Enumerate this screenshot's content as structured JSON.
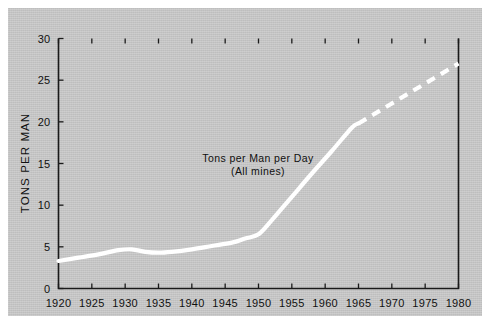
{
  "figure": {
    "background_color": "#c9c9c9",
    "page_color": "#ffffff",
    "line_color": "#ffffff",
    "axis_color": "#1a1a1a"
  },
  "chart_data": {
    "type": "line",
    "title": "",
    "xlabel": "",
    "ylabel": "TONS PER MAN",
    "xlim": [
      1920,
      1980
    ],
    "ylim": [
      0,
      30
    ],
    "grid": false,
    "legend_position": "none",
    "annotations": [
      {
        "line1": "Tons per Man per Day",
        "line2": "(All mines)",
        "x": 1950,
        "y": 17
      }
    ],
    "xticks": [
      1920,
      1925,
      1930,
      1935,
      1940,
      1945,
      1950,
      1955,
      1960,
      1965,
      1970,
      1975,
      1980
    ],
    "xticklabels": [
      "1920",
      "1925",
      "1930",
      "1935",
      "1940",
      "1945",
      "1950",
      "1955",
      "1960",
      "1965",
      "1970",
      "1975",
      "1980"
    ],
    "yticks": [
      0,
      5,
      10,
      15,
      20,
      25,
      30
    ],
    "yticklabels": [
      "0",
      "5",
      "10",
      "15",
      "20",
      "25",
      "30"
    ],
    "series": [
      {
        "name": "Tons per Man per Day (All mines)",
        "style": "solid",
        "color": "#ffffff",
        "x": [
          1920,
          1923,
          1926,
          1929,
          1931,
          1933,
          1935,
          1937,
          1940,
          1943,
          1946,
          1948,
          1950,
          1952,
          1955,
          1958,
          1961,
          1964,
          1965
        ],
        "values": [
          3.3,
          3.7,
          4.1,
          4.6,
          4.7,
          4.4,
          4.3,
          4.4,
          4.7,
          5.1,
          5.5,
          6.0,
          6.5,
          8.2,
          11.0,
          13.8,
          16.5,
          19.3,
          19.8
        ]
      },
      {
        "name": "Tons per Man per Day (All mines) projected",
        "style": "dashed",
        "color": "#ffffff",
        "x": [
          1965,
          1970,
          1975,
          1980
        ],
        "values": [
          19.8,
          22.2,
          24.6,
          27.0
        ]
      }
    ]
  }
}
